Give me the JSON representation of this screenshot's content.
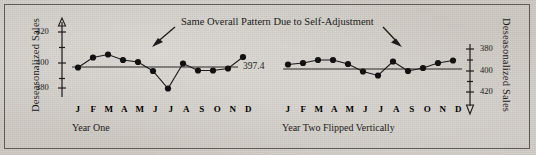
{
  "figure": {
    "background_color": "#cfcbc4",
    "ink_color": "#1b1b1b",
    "annotation": "Same Overall Pattern Due to Self-Adjustment",
    "mean_label": "397.4"
  },
  "axis": {
    "left_title": "Deseasonalized Sales",
    "right_title": "Deseasonalized Sales",
    "left_ticks": [
      "420",
      "400",
      "380"
    ],
    "right_ticks": [
      "380",
      "400",
      "420"
    ]
  },
  "panels": [
    {
      "caption": "Year One",
      "months": [
        "J",
        "F",
        "M",
        "A",
        "M",
        "J",
        "J",
        "A",
        "S",
        "O",
        "N",
        "D"
      ]
    },
    {
      "caption": "Year Two Flipped Vertically",
      "months": [
        "J",
        "F",
        "M",
        "A",
        "M",
        "J",
        "J",
        "A",
        "S",
        "O",
        "N",
        "D"
      ]
    }
  ],
  "chart_data": {
    "type": "line",
    "title": "Same Overall Pattern Due to Self-Adjustment",
    "xlabel": "",
    "ylabel": "Deseasonalized Sales",
    "grid": false,
    "legend": "none",
    "reference_line": {
      "label": "397.4",
      "value": 397.4
    },
    "panels": [
      {
        "name": "Year One",
        "caption": "Year One",
        "categories": [
          "J",
          "F",
          "M",
          "A",
          "M",
          "J",
          "J",
          "A",
          "S",
          "O",
          "N",
          "D"
        ],
        "values": [
          397.0,
          403.5,
          405.5,
          402.0,
          401.0,
          395.5,
          384.5,
          400.0,
          396.5,
          396.5,
          397.5,
          405.0
        ],
        "ylim": [
          375,
          425
        ],
        "yticks": [
          420,
          400,
          380
        ],
        "y_inverted": false
      },
      {
        "name": "Year Two Flipped Vertically",
        "caption": "Year Two Flipped Vertically",
        "categories": [
          "J",
          "F",
          "M",
          "A",
          "M",
          "J",
          "J",
          "A",
          "S",
          "O",
          "N",
          "D"
        ],
        "values": [
          394.5,
          393.5,
          391.0,
          391.0,
          394.0,
          399.0,
          401.5,
          392.5,
          398.0,
          397.0,
          393.5,
          391.5
        ],
        "ylim": [
          375,
          425
        ],
        "yticks": [
          380,
          400,
          420
        ],
        "y_inverted": true
      }
    ],
    "annotations": [
      {
        "text": "Same Overall Pattern Due to Self-Adjustment",
        "points_to": [
          "Year One July",
          "Year Two July"
        ]
      }
    ]
  }
}
